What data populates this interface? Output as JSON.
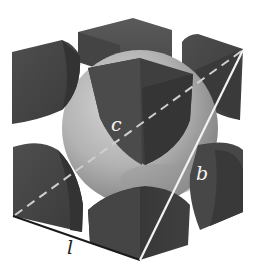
{
  "diagram": {
    "type": "body-centered cubic unit cell",
    "labels": {
      "edge": "l",
      "body_diagonal": "b",
      "face_diagonal_center": "c"
    },
    "colors": {
      "background": "#ffffff",
      "corner_atom_dark": "#3a3a3a",
      "corner_atom_mid": "#4a4a4a",
      "corner_atom_top": "#555555",
      "center_atom_light": "#b8b8b8",
      "center_atom_shadow": "#8c8c8c",
      "edge_line": "#1a1a1a",
      "diagonal_line": "#f2f2f2",
      "dashed_line": "#c8c8c8",
      "label_light": "#f5f5f5",
      "label_dark": "#222222"
    }
  }
}
